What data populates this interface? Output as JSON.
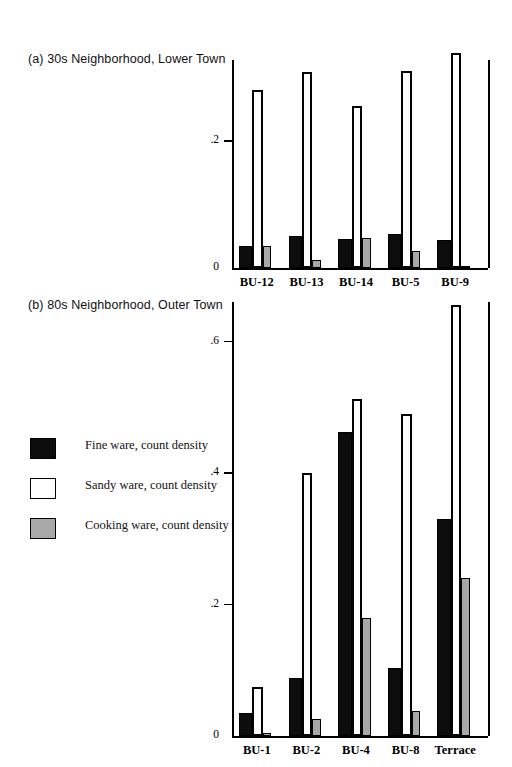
{
  "figure": {
    "panels": [
      {
        "id": "a",
        "title": "(a) 30s Neighborhood, Lower Town"
      },
      {
        "id": "b",
        "title": "(b) 80s Neighborhood, Outer Town"
      }
    ]
  },
  "legend": {
    "items": [
      {
        "key": "fine",
        "label": "Fine ware, count density",
        "color": "#0d0d0d"
      },
      {
        "key": "sandy",
        "label": "Sandy ware, count density",
        "color": "#ffffff"
      },
      {
        "key": "cooking",
        "label": "Cooking ware, count density",
        "color": "#a8a8a8"
      }
    ]
  },
  "chart_data": [
    {
      "type": "bar",
      "title": "(a) 30s Neighborhood, Lower Town",
      "xlabel": "",
      "ylabel": "",
      "ylim": [
        0,
        0.29
      ],
      "yticks": [
        0,
        0.2
      ],
      "ytick_labels": [
        "0",
        ".2"
      ],
      "grid": false,
      "legend_position": "external-left",
      "categories": [
        "BU-12",
        "BU-13",
        "BU-14",
        "BU-5",
        "BU-9"
      ],
      "series": [
        {
          "name": "Fine ware, count density",
          "values": [
            0.035,
            0.05,
            0.046,
            0.053,
            0.044
          ]
        },
        {
          "name": "Sandy ware, count density",
          "values": [
            0.28,
            0.308,
            0.255,
            0.311,
            0.339
          ]
        },
        {
          "name": "Cooking ware, count density",
          "values": [
            0.034,
            0.012,
            0.048,
            0.027,
            0.003
          ]
        }
      ]
    },
    {
      "type": "bar",
      "title": "(b) 80s Neighborhood, Outer Town",
      "xlabel": "",
      "ylabel": "",
      "ylim": [
        0,
        0.67
      ],
      "yticks": [
        0,
        0.2,
        0.4,
        0.6
      ],
      "ytick_labels": [
        "0",
        ".2",
        ".4",
        ".6"
      ],
      "grid": false,
      "legend_position": "external-left",
      "categories": [
        "BU-1",
        "BU-2",
        "BU-4",
        "BU-8",
        "Terrace"
      ],
      "series": [
        {
          "name": "Fine ware, count density",
          "values": [
            0.035,
            0.088,
            0.462,
            0.104,
            0.33
          ]
        },
        {
          "name": "Sandy ware, count density",
          "values": [
            0.075,
            0.4,
            0.512,
            0.49,
            0.655
          ]
        },
        {
          "name": "Cooking ware, count density",
          "values": [
            0.005,
            0.026,
            0.18,
            0.038,
            0.24
          ]
        }
      ]
    }
  ]
}
